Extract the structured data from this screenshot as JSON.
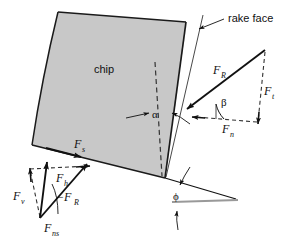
{
  "figure": {
    "background_color": "#ffffff",
    "line_color": "#111111",
    "chip_fill_color": "#c8c8c8",
    "chip_stroke_color": "#1a1a1a",
    "workpiece_line_color": "#999999"
  },
  "labels": {
    "chip": "chip",
    "rake_face": "rake face",
    "alpha": "α",
    "beta": "β",
    "phi": "ϕ",
    "F_R_upper": "F",
    "F_R_upper_sub": "R",
    "F_t": "F",
    "F_t_sub": "t",
    "F_n": "F",
    "F_n_sub": "n",
    "F_s": "F",
    "F_s_sub": "s",
    "F_h": "F",
    "F_h_sub": "h",
    "F_v": "F",
    "F_v_sub": "v",
    "neg_F_R": "−F",
    "neg_F_R_sub": "R",
    "F_ns": "F",
    "F_ns_sub": "ns"
  },
  "vectors": [
    {
      "name": "F_R",
      "label": "F_R",
      "style": "solid",
      "description": "resultant force on rake face, pointing down-left toward tool tip"
    },
    {
      "name": "F_t",
      "label": "F_t",
      "style": "dashed",
      "description": "thrust/tangential component, vertical downward"
    },
    {
      "name": "F_n",
      "label": "F_n",
      "style": "dashed",
      "description": "normal component, horizontal pointing left"
    },
    {
      "name": "F_s",
      "label": "F_s",
      "style": "solid",
      "description": "shear force along shear plane, pointing down-right"
    },
    {
      "name": "F_h",
      "label": "F_h",
      "style": "dashed",
      "description": "horizontal component, pointing right"
    },
    {
      "name": "F_v",
      "label": "F_v",
      "style": "dashed",
      "description": "vertical component, pointing up"
    },
    {
      "name": "-F_R",
      "label": "−F_R",
      "style": "solid",
      "description": "reaction resultant force, pointing up-right"
    },
    {
      "name": "F_ns",
      "label": "F_ns",
      "style": "solid",
      "description": "normal force on shear plane, pointing up"
    }
  ],
  "angles": [
    {
      "name": "alpha",
      "symbol": "α",
      "description": "rake angle between vertical dashed reference and rake face"
    },
    {
      "name": "beta",
      "symbol": "β",
      "description": "friction angle between resultant force and normal force"
    },
    {
      "name": "phi",
      "symbol": "ϕ",
      "description": "shear plane angle between shear plane and workpiece surface"
    }
  ]
}
